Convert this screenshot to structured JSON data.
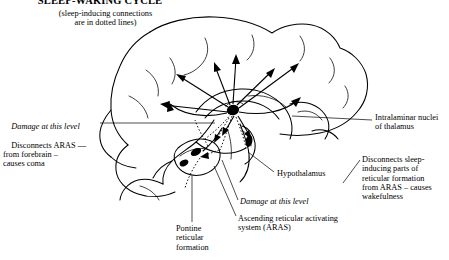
{
  "figure": {
    "title": "SLEEP-WAKING CYCLE",
    "subtitle": "(sleep-inducing connections\nare in dotted lines)",
    "background_color": "#ffffff",
    "ink_color": "#000000"
  },
  "annotations": {
    "damage_forebrain": {
      "emphasis_line": "Damage at this level",
      "body": "Disconnects ARAS —\nfrom forebrain –\ncauses coma"
    },
    "intralaminar": {
      "label": "Intralaminar nuclei\nof thalamus"
    },
    "hypothalamus": {
      "label": "Hypothalamus"
    },
    "disconnect_sleep": {
      "label": "Disconnects sleep-\ninducing parts of\nreticular formation\nfrom ARAS – causes\nwakefulness"
    },
    "damage_level_2": {
      "emphasis_line": "Damage at this level"
    },
    "aras": {
      "label": "Ascending reticular activating\nsystem (ARAS)"
    },
    "pontine": {
      "label": "Pontine\nreticular\nformation"
    }
  }
}
